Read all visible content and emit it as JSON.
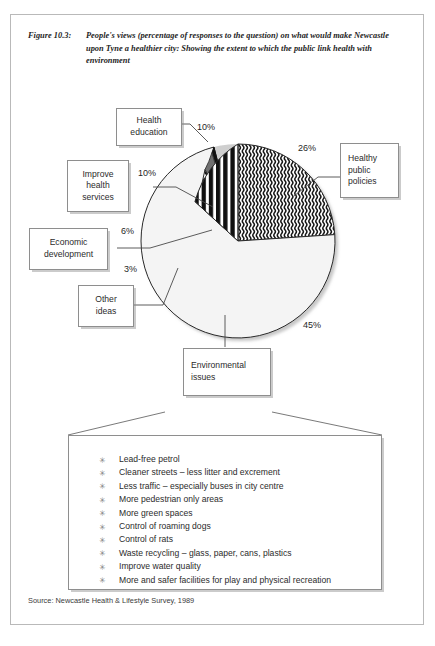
{
  "figure": {
    "number": "Figure 10.3:",
    "caption": "People's views (percentage of responses to the question) on what  would make Newcastle upon Tyne a healthier city: Showing the extent to which the public link health with environment",
    "source": "Source: Newcastle Health & Lifestyle Survey, 1989"
  },
  "callouts": {
    "health_education": "Health\neducation",
    "improve_health_services": "Improve\nhealth\nservices",
    "economic_development": "Economic\ndevelopment",
    "other_ideas": "Other\nideas",
    "healthy_public_policies": "Healthy\npublic\npolicies",
    "environmental_issues": "Environmental\nissues"
  },
  "percent_labels": {
    "health_education": "10%",
    "improve_health_services": "10%",
    "economic_development": "6%",
    "other_ideas": "3%",
    "healthy_public_policies": "26%",
    "environmental_issues": "45%"
  },
  "detail_bullets": [
    "Lead-free petrol",
    "Cleaner streets – less litter and excrement",
    "Less traffic – especially buses in city centre",
    "More pedestrian only areas",
    "More green spaces",
    "Control of roaming dogs",
    "Control of rats",
    "Waste recycling – glass, paper, cans, plastics",
    "Improve water quality",
    "More and safer facilities for play and physical recreation"
  ],
  "bullet_glyph": "✳",
  "chart_data": {
    "type": "pie",
    "title": "People's views (percentage of responses to the question) on what would make Newcastle upon Tyne a healthier city",
    "categories": [
      "Healthy public policies",
      "Environmental issues",
      "Other ideas",
      "Economic development",
      "Improve health services",
      "Health education"
    ],
    "values": [
      26,
      45,
      3,
      6,
      10,
      10
    ],
    "labels": [
      "26%",
      "45%",
      "3%",
      "6%",
      "10%",
      "10%"
    ],
    "fills": [
      "wavy-lines",
      "white",
      "black",
      "gray",
      "diagonal-hatch",
      "vertical-bars"
    ],
    "colors": [
      "#ffffff",
      "#f2f2f2",
      "#111111",
      "#6f6f6f",
      "#ffffff",
      "#ffffff"
    ],
    "start_angle_deg": 0,
    "direction": "clockwise",
    "legend": "callout-boxes",
    "grid": false
  }
}
